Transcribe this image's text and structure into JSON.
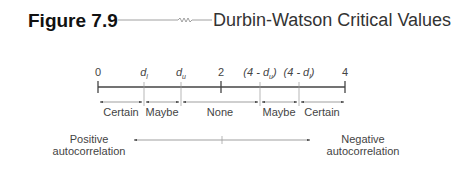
{
  "figure": {
    "number": "Figure 7.9",
    "title": "Durbin-Watson Critical Values"
  },
  "number_line": {
    "ticks": [
      {
        "label": "0",
        "x": 98
      },
      {
        "label": "d_l",
        "x": 144
      },
      {
        "label": "d_u",
        "x": 181
      },
      {
        "label": "2",
        "x": 221
      },
      {
        "label": "(4 - d_u)",
        "x": 260
      },
      {
        "label": "(4 - d_l)",
        "x": 299
      },
      {
        "label": "4",
        "x": 345
      }
    ],
    "labels": {
      "t0": "0",
      "t1_main": "d",
      "t1_sub": "l",
      "t2_main": "d",
      "t2_sub": "u",
      "t3": "2",
      "t4_pre": "(4 - ",
      "t4_main": "d",
      "t4_sub": "u",
      "t4_post": ")",
      "t5_pre": "(4 - ",
      "t5_main": "d",
      "t5_sub": "l",
      "t5_post": ")",
      "t6": "4"
    },
    "regions": [
      "Certain",
      "Maybe",
      "None",
      "Maybe",
      "Certain"
    ]
  },
  "direction": {
    "left": "Positive\nautocorrelation",
    "left_line1": "Positive",
    "left_line2": "autocorrelation",
    "right_line1": "Negative",
    "right_line2": "autocorrelation"
  },
  "colors": {
    "line": "#555555",
    "text": "#444444"
  }
}
